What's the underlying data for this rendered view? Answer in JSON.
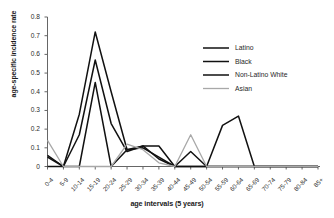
{
  "chart_data": {
    "type": "line",
    "title": "",
    "xlabel": "age intervals (5 years)",
    "ylabel": "age-specific incidence rate",
    "categories": [
      "0-4",
      "5-9",
      "10-14",
      "15-19",
      "20-24",
      "25-29",
      "30-34",
      "35-39",
      "40-44",
      "45-49",
      "50-54",
      "55-59",
      "60-64",
      "65-69",
      "70-74",
      "75-79",
      "80-84",
      "85+"
    ],
    "ylim": [
      0,
      0.8
    ],
    "yticks": [
      "0",
      "0.1",
      "0.2",
      "0.3",
      "0.4",
      "0.5",
      "0.6",
      "0.7",
      "0.8"
    ],
    "ytick_values": [
      0,
      0.1,
      0.2,
      0.3,
      0.4,
      0.5,
      0.6,
      0.7,
      0.8
    ],
    "grid": false,
    "legend_position": "upper right",
    "series": [
      {
        "name": "Latino",
        "color": "#111111",
        "width": 1.5,
        "values": [
          0.06,
          0.0,
          0.28,
          0.72,
          0.4,
          0.09,
          0.11,
          0.04,
          0.0,
          0.08,
          0.0,
          0.22,
          0.27,
          0.0,
          0.0,
          0.0,
          0.0,
          0.0
        ]
      },
      {
        "name": "Black",
        "color": "#111111",
        "width": 1.5,
        "values": [
          0.05,
          0.0,
          0.17,
          0.57,
          0.23,
          0.08,
          0.11,
          0.11,
          0.0,
          0.0,
          0.0,
          0.0,
          0.0,
          0.0,
          0.0,
          0.0,
          0.0,
          0.0
        ]
      },
      {
        "name": "Non-Latino White",
        "color": "#111111",
        "width": 1.5,
        "values": [
          0.0,
          0.0,
          0.0,
          0.45,
          0.0,
          0.09,
          0.1,
          0.05,
          0.0,
          0.0,
          0.0,
          0.0,
          0.0,
          0.0,
          0.0,
          0.0,
          0.0,
          0.0
        ]
      },
      {
        "name": "Asian",
        "color": "#a8a8a8",
        "width": 1.3,
        "values": [
          0.14,
          0.0,
          0.0,
          0.0,
          0.0,
          0.12,
          0.09,
          0.02,
          0.0,
          0.17,
          0.0,
          0.0,
          0.0,
          0.0,
          0.0,
          0.0,
          0.0,
          0.0
        ]
      }
    ]
  },
  "legend": {
    "items": [
      {
        "label": "Latino"
      },
      {
        "label": "Black"
      },
      {
        "label": "Non-Latino White"
      },
      {
        "label": "Asian"
      }
    ]
  },
  "axes": {
    "y_title": "age-specific incidence rate",
    "x_title": "age intervals (5 years)"
  }
}
